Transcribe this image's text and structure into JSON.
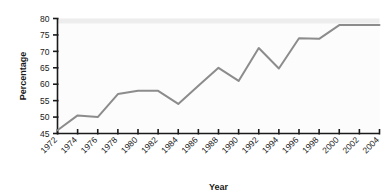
{
  "chart_data": {
    "type": "line",
    "title": "",
    "xlabel": "Year",
    "ylabel": "Percentage",
    "x": [
      1972,
      1974,
      1976,
      1978,
      1980,
      1982,
      1984,
      1986,
      1988,
      1990,
      1992,
      1994,
      1996,
      1998,
      2000,
      2002,
      2004
    ],
    "values": [
      46,
      50.5,
      50,
      57,
      58,
      58,
      54,
      59.5,
      65,
      61,
      71,
      64.8,
      74,
      73.8,
      78,
      78,
      78
    ],
    "categories": [
      "1972",
      "1974",
      "1976",
      "1978",
      "1980",
      "1982",
      "1984",
      "1986",
      "1988",
      "1990",
      "1992",
      "1994",
      "1996",
      "1998",
      "2000",
      "2002",
      "2004"
    ],
    "xlim": [
      1972,
      2004
    ],
    "ylim": [
      45,
      80
    ],
    "ytick_labels": [
      "45",
      "50",
      "55",
      "60",
      "65",
      "70",
      "75",
      "80"
    ],
    "yticks": [
      45,
      50,
      55,
      60,
      65,
      70,
      75,
      80
    ],
    "grid": false,
    "legend": null,
    "line_color": "#8c8c8c",
    "axis_color": "#1a1a1a",
    "plot_background": "#fcfcfc"
  }
}
